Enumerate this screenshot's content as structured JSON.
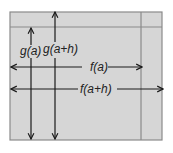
{
  "diagram": {
    "background_color": "#ffffff",
    "region_fill": "#d6d6d6",
    "line_color": "#8a8a8a",
    "arrow_color": "#1a1a1a",
    "labels": {
      "g_a": "g(a)",
      "g_a_h": "g(a+h)",
      "f_a": "f(a)",
      "f_a_h": "f(a+h)"
    }
  }
}
